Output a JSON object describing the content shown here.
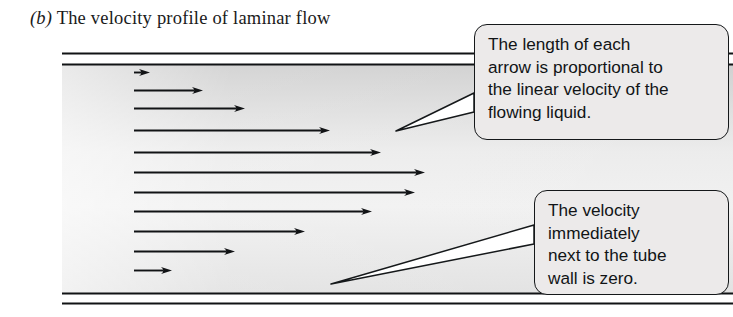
{
  "caption": {
    "label": "(b)",
    "text": "The velocity profile of laminar flow"
  },
  "diagram": {
    "name": "laminar-flow-velocity-profile",
    "tube": {
      "wall_color": "#111315",
      "fill_top_color": "#d3d3d3",
      "fill_mid_color": "#f2f2f2",
      "left_x": 62,
      "right_x": 733,
      "top_outer_y": 53,
      "top_inner_y": 64,
      "bottom_inner_y": 293,
      "bottom_outer_y": 303
    },
    "arrows": {
      "color": "#111315",
      "start_x": 134,
      "items": [
        {
          "y": 72,
          "tip_x": 150
        },
        {
          "y": 90,
          "tip_x": 203
        },
        {
          "y": 108,
          "tip_x": 245
        },
        {
          "y": 130,
          "tip_x": 330
        },
        {
          "y": 152,
          "tip_x": 381
        },
        {
          "y": 172,
          "tip_x": 425
        },
        {
          "y": 192,
          "tip_x": 415
        },
        {
          "y": 211,
          "tip_x": 372
        },
        {
          "y": 231,
          "tip_x": 305
        },
        {
          "y": 251,
          "tip_x": 235
        },
        {
          "y": 270,
          "tip_x": 172
        }
      ]
    },
    "leaders": [
      {
        "name": "leader-upper",
        "tip_x": 396,
        "tip_y": 131,
        "base_x": 474,
        "base_top_y": 93,
        "base_bottom_y": 112
      },
      {
        "name": "leader-lower",
        "tip_x": 331,
        "tip_y": 284,
        "base_x": 534,
        "base_top_y": 225,
        "base_bottom_y": 244
      }
    ]
  },
  "callouts": [
    {
      "name": "callout-arrow-length",
      "lines": [
        "The length of each",
        "arrow is proportional to",
        "the linear velocity of the",
        "flowing liquid."
      ]
    },
    {
      "name": "callout-wall-velocity",
      "lines": [
        "The velocity",
        "immediately",
        "next to the tube",
        "wall is zero."
      ]
    }
  ]
}
